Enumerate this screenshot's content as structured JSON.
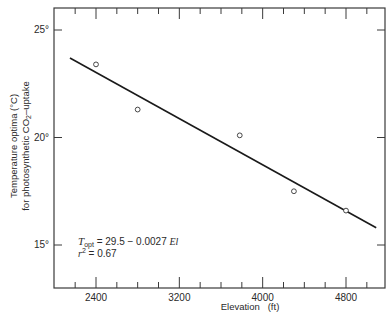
{
  "chart_data": {
    "type": "scatter",
    "title": "",
    "xlabel": "Elevation   (ft)",
    "ylabel_line1": "Temperature optima (°C)",
    "ylabel_line2_prefix": "for photosynthetic CO",
    "ylabel_line2_sub": "2",
    "ylabel_line2_suffix": "–uptake",
    "xlim": [
      2000,
      5180
    ],
    "ylim": [
      13,
      26
    ],
    "x_ticks_major": [
      2400,
      3200,
      4000,
      4800
    ],
    "x_tick_labels": [
      "2400",
      "3200",
      "4000",
      "4800"
    ],
    "x_minor_step": 200,
    "y_ticks_major": [
      15,
      20,
      25
    ],
    "y_tick_labels": [
      "15°",
      "20°",
      "25°"
    ],
    "grid": false,
    "series": [
      {
        "name": "observed",
        "marker": "open-circle",
        "x": [
          2400,
          2800,
          3780,
          4300,
          4800
        ],
        "y": [
          23.4,
          21.3,
          20.1,
          17.5,
          16.6
        ]
      }
    ],
    "fit_line": {
      "intercept": 29.5,
      "slope": -0.0027,
      "x_range": [
        2150,
        5090
      ],
      "y_at_start": 23.7,
      "y_at_end": 15.8
    },
    "annotations": {
      "equation_T": "T",
      "equation_T_sub": "opt",
      "equation_rest": " = 29.5 − 0.0027 ",
      "equation_var": "El",
      "r2_label": "r",
      "r2_sup": "2",
      "r2_value": " = 0.67"
    }
  }
}
